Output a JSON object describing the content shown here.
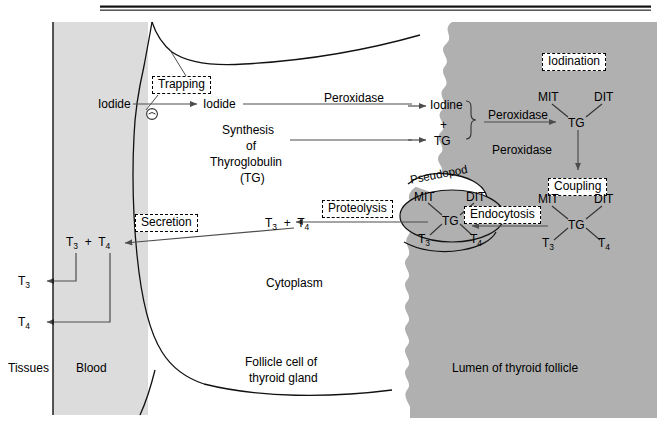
{
  "figure": {
    "title_rule": "double-rule",
    "colors": {
      "blood": "#dcdcdc",
      "lumen": "#b0b0b0",
      "colloid_droplet": "#b0b0b0",
      "cytoplasm": "#ffffff",
      "stroke": "#000000",
      "arrow": "#4d4d4d"
    }
  },
  "regions": {
    "tissues": "Tissues",
    "blood": "Blood",
    "cell": "Follicle cell of",
    "cell2": "thyroid gland",
    "cytoplasm": "Cytoplasm",
    "lumen": "Lumen of thyroid follicle"
  },
  "steps": {
    "trapping": "Trapping",
    "secretion": "Secretion",
    "proteolysis": "Proteolysis",
    "endocytosis": "Endocytosis",
    "iodination": "Iodination",
    "coupling": "Coupling"
  },
  "molecules": {
    "iodide_blood": "Iodide",
    "iodide_cell": "Iodide",
    "iodine": "Iodine",
    "plus_sign": "+",
    "tg": "TG",
    "mit": "MIT",
    "dit": "DIT",
    "t3": "T",
    "t3_sub": "3",
    "t4": "T",
    "t4_sub": "4",
    "pump_symbol": "⊖"
  },
  "enzymes": {
    "peroxidase_1": "Peroxidase",
    "peroxidase_2": "Peroxidase",
    "peroxidase_3": "Peroxidase"
  },
  "synthesis": {
    "line1": "Synthesis",
    "line2": "of",
    "line3": "Thyroglobulin",
    "line4": "(TG)"
  },
  "structures": {
    "pseudopod": "Pseudopod"
  },
  "hormone_pairs": {
    "in_cell": "T3 + T4",
    "in_blood": "T3 + T4",
    "to_tissue_t3": "T3",
    "to_tissue_t4": "T4"
  }
}
